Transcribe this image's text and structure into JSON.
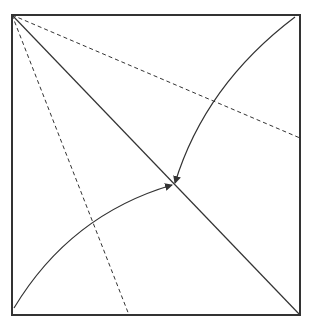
{
  "diagram": {
    "type": "folding-diagram",
    "stroke_color": "#333333",
    "background": "#ffffff",
    "square": {
      "x": 12,
      "y": 15,
      "width": 288,
      "height": 300
    },
    "diagonal": {
      "x1": 12,
      "y1": 15,
      "x2": 300,
      "y2": 315,
      "style": "solid"
    },
    "dashed_lines": [
      {
        "x1": 12,
        "y1": 15,
        "x2": 300,
        "y2": 138,
        "style": "dashed"
      },
      {
        "x1": 12,
        "y1": 15,
        "x2": 129,
        "y2": 315,
        "style": "dashed"
      }
    ],
    "arrows": [
      {
        "from": "top-right corner",
        "to": "diagonal point",
        "path": "M295,17 Q205,85 175,183"
      },
      {
        "from": "bottom-left corner",
        "to": "diagonal point",
        "path": "M14,308 Q70,215 172,185"
      }
    ]
  }
}
